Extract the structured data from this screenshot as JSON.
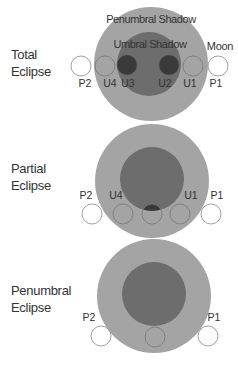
{
  "colors": {
    "penumbra": "#a4a4a4",
    "umbra": "#6d6d6d",
    "moon_in_umbra": "#3a3a3a",
    "moon_outline": "#777777",
    "text": "#333333"
  },
  "diagrams": [
    {
      "label_line1": "Total",
      "label_line2": "Eclipse",
      "penumbra_label": "Penumbral Shadow",
      "umbra_label": "Umbral Shadow",
      "moon_label": "Moon",
      "contacts": [
        "P2",
        "U4",
        "U3",
        "U2",
        "U1",
        "P1"
      ]
    },
    {
      "label_line1": "Partial",
      "label_line2": "Eclipse",
      "contacts": [
        "P2",
        "U4",
        "U1",
        "P1"
      ]
    },
    {
      "label_line1": "Penumbral",
      "label_line2": "Eclipse",
      "contacts": [
        "P2",
        "P1"
      ]
    }
  ]
}
